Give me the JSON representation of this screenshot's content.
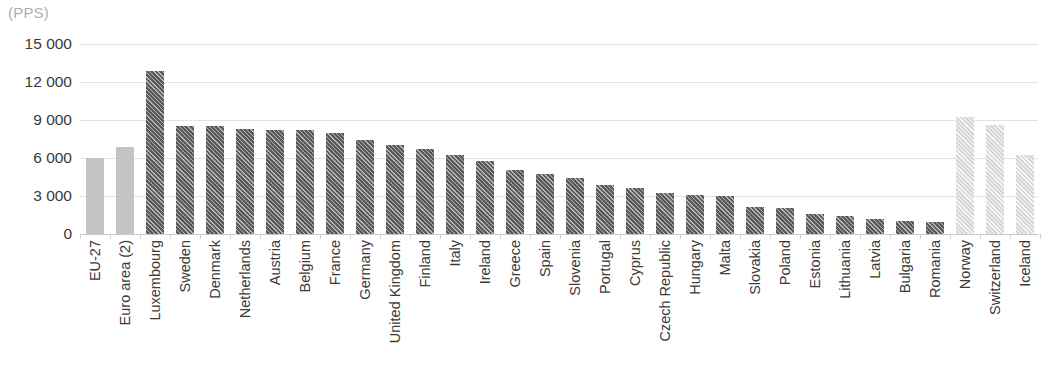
{
  "chart_data": {
    "type": "bar",
    "title": "",
    "subtitle": "",
    "unit_label": "(PPS)",
    "xlabel": "",
    "ylabel": "",
    "ylim": [
      0,
      15000
    ],
    "yticks": [
      0,
      3000,
      6000,
      9000,
      12000,
      15000
    ],
    "ytick_labels": [
      "0",
      "3 000",
      "6 000",
      "9 000",
      "12 000",
      "15 000"
    ],
    "grid": true,
    "legend": "none",
    "categories": [
      "EU-27",
      "Euro area (2)",
      "Luxembourg",
      "Sweden",
      "Denmark",
      "Netherlands",
      "Austria",
      "Belgium",
      "France",
      "Germany",
      "United Kingdom",
      "Finland",
      "Italy",
      "Ireland",
      "Greece",
      "Spain",
      "Slovenia",
      "Portugal",
      "Cyprus",
      "Czech Republic",
      "Hungary",
      "Malta",
      "Slovakia",
      "Poland",
      "Estonia",
      "Lithuania",
      "Latvia",
      "Bulgaria",
      "Romania",
      "Norway",
      "Switzerland",
      "Iceland"
    ],
    "values": [
      6000,
      6900,
      12850,
      8500,
      8500,
      8300,
      8250,
      8200,
      8000,
      7450,
      7050,
      6700,
      6200,
      5800,
      5050,
      4700,
      4400,
      3900,
      3650,
      3200,
      3050,
      3000,
      2100,
      2050,
      1600,
      1400,
      1150,
      1050,
      950,
      9250,
      8600,
      6200
    ],
    "series_styles": [
      "aggregate",
      "aggregate",
      "dark",
      "dark",
      "dark",
      "dark",
      "dark",
      "dark",
      "dark",
      "dark",
      "dark",
      "dark",
      "dark",
      "dark",
      "dark",
      "dark",
      "dark",
      "dark",
      "dark",
      "dark",
      "dark",
      "dark",
      "dark",
      "dark",
      "dark",
      "dark",
      "dark",
      "dark",
      "dark",
      "light",
      "light",
      "light"
    ],
    "colors": {
      "aggregate_bar": "#c4c4c4",
      "member_state_bar": "#5a5a5a",
      "non_member_bar": "#d8d8d8",
      "gridline": "#e3e3e3",
      "axis": "#c9c9c9",
      "text": "#3a3a3a",
      "unit_text": "#b0b0b0",
      "background": "#ffffff"
    }
  }
}
